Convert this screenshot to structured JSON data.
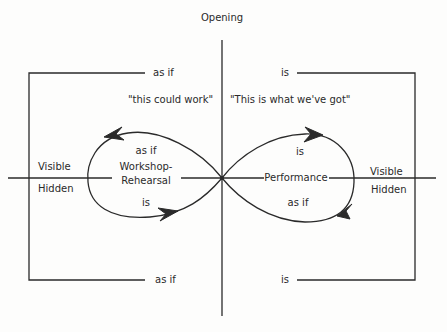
{
  "diagram": {
    "top_label": "Opening",
    "left_box": {
      "top_label": "as if",
      "bottom_label": "as if",
      "quote": "\"this could work\""
    },
    "right_box": {
      "top_label": "is",
      "bottom_label": "is",
      "quote": "\"This is what we've got\""
    },
    "left_loop": {
      "upper_label": "as if",
      "name_line1": "Workshop-",
      "name_line2": "Rehearsal",
      "lower_label": "is"
    },
    "right_loop": {
      "upper_label": "is",
      "name": "Performance",
      "lower_label": "as if"
    },
    "left_side": {
      "above": "Visible",
      "below": "Hidden"
    },
    "right_side": {
      "above": "Visible",
      "below": "Hidden"
    },
    "colors": {
      "ink": "#2a2a2a",
      "background": "#fdfdfc"
    }
  }
}
